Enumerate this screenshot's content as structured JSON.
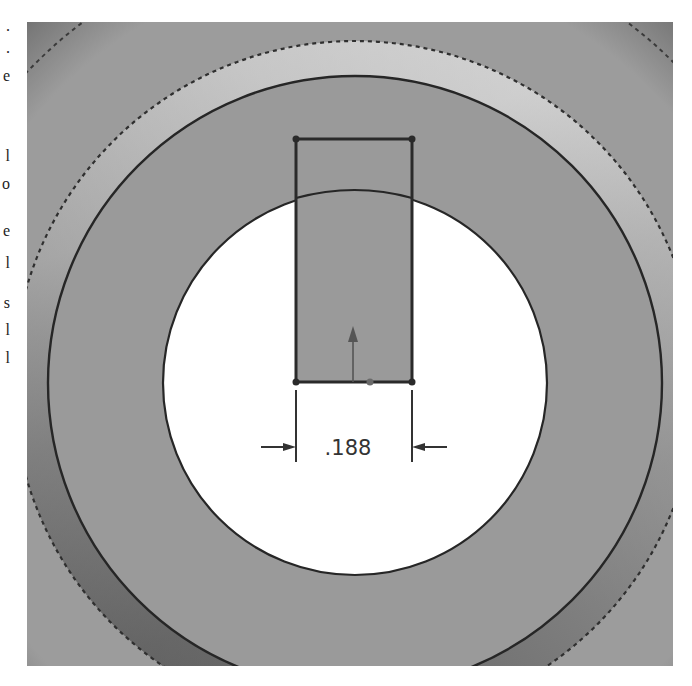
{
  "page": {
    "margin_fragments": [
      ".",
      ".",
      "e",
      "l",
      "o",
      "e",
      "l",
      "s",
      "l",
      "l"
    ]
  },
  "viewport": {
    "type": "cad-sketch-view",
    "background_color": "#9b9b9b",
    "face_color": "#9a9a9a",
    "hole_color": "#ffffff",
    "sketch_line_color": "#2a2a2a"
  },
  "sketch": {
    "entities": [
      {
        "type": "rectangle",
        "name": "keyway-rectangle"
      },
      {
        "type": "circle",
        "name": "bore-circle"
      },
      {
        "type": "origin-arrow",
        "name": "sketch-origin"
      }
    ],
    "dimension": {
      "label": ".188",
      "kind": "linear-horizontal"
    }
  }
}
